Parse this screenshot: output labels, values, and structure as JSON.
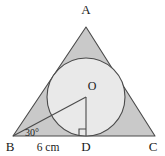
{
  "figure": {
    "kind": "incircle-of-triangle",
    "canvas": {
      "width": 165,
      "height": 156
    },
    "colors": {
      "triangle_fill": "#c9c9c9",
      "circle_fill": "#e9e9e9",
      "stroke": "#4a4a4a",
      "label_color": "#1a1a1a",
      "background": "#ffffff"
    },
    "labels": {
      "apex": "A",
      "bottom_left": "B",
      "bottom_right": "C",
      "foot_of_perpendicular": "D",
      "centre": "O",
      "angle": "30°",
      "side_measure": "6 cm"
    },
    "points": {
      "A": {
        "x": 86,
        "y": 27
      },
      "B": {
        "x": 13,
        "y": 136
      },
      "C": {
        "x": 155,
        "y": 136
      },
      "D": {
        "x": 86,
        "y": 136
      },
      "O": {
        "x": 86,
        "y": 97
      }
    },
    "circle": {
      "cx": 86,
      "cy": 97,
      "r": 39
    },
    "label_positions": {
      "A": {
        "x": 86,
        "y": 14
      },
      "B": {
        "x": 10,
        "y": 151
      },
      "C": {
        "x": 153,
        "y": 151
      },
      "D": {
        "x": 86,
        "y": 151
      },
      "O": {
        "x": 92,
        "y": 90
      },
      "angle": {
        "x": 32,
        "y": 136
      },
      "measure": {
        "x": 48,
        "y": 151
      }
    },
    "right_angle_marker": {
      "size": 7,
      "at": "D"
    }
  }
}
